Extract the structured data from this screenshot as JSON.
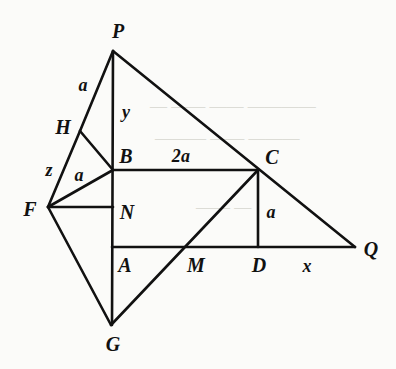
{
  "figure": {
    "width": 396,
    "height": 369,
    "background_color": "#fbfbf9",
    "stroke_color": "#111111",
    "label_color": "#111111"
  },
  "points": [
    {
      "id": "P",
      "label": "P",
      "x": 113,
      "y": 51,
      "label_x": 118,
      "label_y": 31
    },
    {
      "id": "H",
      "label": "H",
      "x": 80,
      "y": 131,
      "label_x": 63,
      "label_y": 127
    },
    {
      "id": "B",
      "label": "B",
      "x": 113,
      "y": 170,
      "label_x": 126,
      "label_y": 156
    },
    {
      "id": "C",
      "label": "C",
      "x": 258,
      "y": 170,
      "label_x": 272,
      "label_y": 157
    },
    {
      "id": "F",
      "label": "F",
      "x": 48,
      "y": 207,
      "label_x": 30,
      "label_y": 209
    },
    {
      "id": "N",
      "label": "N",
      "x": 113,
      "y": 207,
      "label_x": 127,
      "label_y": 212
    },
    {
      "id": "A",
      "label": "A",
      "x": 113,
      "y": 247,
      "label_x": 125,
      "label_y": 265
    },
    {
      "id": "M",
      "label": "M",
      "x": 188,
      "y": 247,
      "label_x": 196,
      "label_y": 265
    },
    {
      "id": "D",
      "label": "D",
      "x": 258,
      "y": 247,
      "label_x": 259,
      "label_y": 265
    },
    {
      "id": "Q",
      "label": "Q",
      "x": 355,
      "y": 247,
      "label_x": 371,
      "label_y": 249
    },
    {
      "id": "G",
      "label": "G",
      "x": 111,
      "y": 325,
      "label_x": 113,
      "label_y": 344
    }
  ],
  "segments": [
    {
      "id": "P-Q",
      "from": "P",
      "to": "Q",
      "note": "long hypotenuse through C"
    },
    {
      "id": "P-H",
      "from": "P",
      "to": "H",
      "note": "upper left side, length a"
    },
    {
      "id": "H-F",
      "from": "H",
      "to": "F",
      "note": "lower left side, length z"
    },
    {
      "id": "H-B",
      "from": "H",
      "to": "B",
      "note": "cross segment"
    },
    {
      "id": "P-A",
      "from": "P",
      "to": "A",
      "note": "vertical through B and N"
    },
    {
      "id": "A-G",
      "from": "A",
      "to": "G",
      "note": "vertical continuation"
    },
    {
      "id": "B-C",
      "from": "B",
      "to": "C",
      "note": "horizontal, length 2a"
    },
    {
      "id": "F-B",
      "from": "F",
      "to": "B",
      "note": "diagonal, length a"
    },
    {
      "id": "F-N",
      "from": "F",
      "to": "N",
      "note": "horizontal"
    },
    {
      "id": "F-G",
      "from": "F",
      "to": "G",
      "note": "diagonal down-right"
    },
    {
      "id": "A-Q",
      "from": "A",
      "to": "Q",
      "note": "horizontal base through M and D"
    },
    {
      "id": "C-D",
      "from": "C",
      "to": "D",
      "note": "vertical, length a"
    },
    {
      "id": "G-C",
      "from": "G",
      "to": "C",
      "note": "diagonal through M"
    }
  ],
  "length_labels": [
    {
      "id": "a-PH",
      "text": "a",
      "x": 83,
      "y": 85,
      "for_segment": "P-H"
    },
    {
      "id": "y-PB",
      "text": "y",
      "x": 126,
      "y": 112,
      "for_segment": "P-B"
    },
    {
      "id": "z-HF",
      "text": "z",
      "x": 49,
      "y": 170,
      "for_segment": "H-F"
    },
    {
      "id": "a-FB",
      "text": "a",
      "x": 79,
      "y": 175,
      "for_segment": "F-B"
    },
    {
      "id": "2a-BC",
      "text": "2a",
      "x": 181,
      "y": 156,
      "for_segment": "B-C"
    },
    {
      "id": "a-CD",
      "text": "a",
      "x": 271,
      "y": 212,
      "for_segment": "C-D"
    },
    {
      "id": "x-DQ",
      "text": "x",
      "x": 307,
      "y": 266,
      "for_segment": "D-Q"
    }
  ],
  "bleed_text": [
    {
      "id": "bleed-1",
      "text": "— ——  —— ————",
      "x": 150,
      "y": 104
    },
    {
      "id": "bleed-2",
      "text": "———  —— ———",
      "x": 155,
      "y": 136
    },
    {
      "id": "bleed-3",
      "text": "—— —",
      "x": 196,
      "y": 205
    }
  ]
}
